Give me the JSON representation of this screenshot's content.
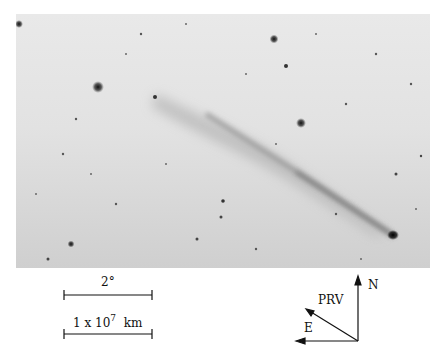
{
  "figure": {
    "type": "astronomical-photograph",
    "photo_colors": {
      "sky": "#e4e4e4",
      "stars": "#222222",
      "tail": "#9a9a9a"
    }
  },
  "scale_bars": [
    {
      "label": "2°",
      "length_px": 88
    },
    {
      "label_main": "1 x 10",
      "label_exp": "7",
      "label_unit": "km",
      "length_px": 88
    }
  ],
  "compass": {
    "north": "N",
    "east": "E",
    "prv": "PRV"
  }
}
